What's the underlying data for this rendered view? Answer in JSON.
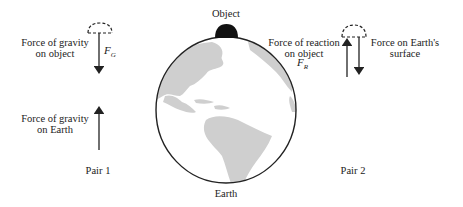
{
  "labels": {
    "object": "Object",
    "earth": "Earth",
    "pair1": {
      "title": "Pair 1",
      "gravity_on_object_line1": "Force of gravity",
      "gravity_on_object_line2": "on object",
      "gravity_on_object_symbol": "F",
      "gravity_on_object_subscript": "G",
      "gravity_on_earth_line1": "Force of gravity",
      "gravity_on_earth_line2": "on Earth"
    },
    "pair2": {
      "title": "Pair 2",
      "reaction_on_object_line1": "Force of reaction",
      "reaction_on_object_line2": "on object",
      "reaction_on_object_symbol": "F",
      "reaction_on_object_subscript": "R",
      "force_on_surface_line1": "Force on Earth's",
      "force_on_surface_line2": "surface"
    }
  },
  "colors": {
    "line": "#222222",
    "land": "#cfcfcf",
    "object_fill": "#111111"
  }
}
